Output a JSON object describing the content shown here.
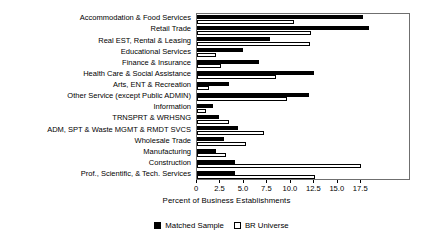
{
  "chart_data": {
    "type": "bar",
    "orientation": "horizontal",
    "title": "",
    "xlabel": "Percent of Business Establishments",
    "ylabel": "",
    "xlim": [
      0,
      22.8
    ],
    "xticks": [
      0,
      2.5,
      5.0,
      7.5,
      10.0,
      12.5,
      15.0,
      17.5
    ],
    "xticklabels": [
      "0",
      "2.5",
      "5.0",
      "7.5",
      "10.0",
      "12.5",
      "15.0",
      "17.5"
    ],
    "grid": false,
    "legend_position": "below-axis-center",
    "categories": [
      "Accommodation & Food Services",
      "Retail Trade",
      "Real EST, Rental & Leasing",
      "Educational Services",
      "Finance & Insurance",
      "Health Care & Social Assistance",
      "Arts, ENT & Recreation",
      "Other Service (except Public ADMIN)",
      "Information",
      "TRNSPRT & WRHSNG",
      "ADM, SPT & Waste MGMT & RMDT SVCS",
      "Wholesale Trade",
      "Manufacturing",
      "Construction",
      "Prof., Scientific, & Tech. Services"
    ],
    "series": [
      {
        "name": "Matched Sample",
        "color": "#000000",
        "values": [
          17.7,
          18.3,
          7.8,
          4.9,
          6.6,
          12.5,
          3.4,
          11.9,
          1.7,
          2.3,
          4.4,
          2.9,
          2.0,
          4.1,
          4.0
        ]
      },
      {
        "name": "BR Universe",
        "color": "#ffffff",
        "values": [
          10.3,
          12.1,
          12.0,
          2.0,
          2.6,
          8.4,
          1.3,
          9.6,
          1.0,
          3.4,
          7.1,
          5.2,
          3.1,
          17.5,
          12.6
        ]
      }
    ]
  },
  "legend": {
    "items": [
      {
        "label": "Matched Sample",
        "style": "filled"
      },
      {
        "label": "BR Universe",
        "style": "outline"
      }
    ]
  },
  "axis": {
    "x_title": "Percent of Business Establishments"
  }
}
